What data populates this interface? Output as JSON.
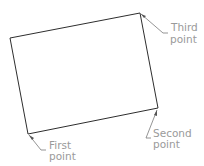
{
  "diagram": {
    "colors": {
      "outline": "#2e2e2e",
      "leader": "#7a7a7a",
      "label": "#9a9a9a",
      "background": "#ffffff"
    },
    "vertices": {
      "first": [
        28,
        134
      ],
      "second": [
        158,
        108
      ],
      "third": [
        140,
        13
      ],
      "fourth": [
        10,
        38
      ]
    },
    "labels": {
      "first": {
        "line1": "First",
        "line2": "point"
      },
      "second": {
        "line1": "Second",
        "line2": "point"
      },
      "third": {
        "line1": "Third",
        "line2": "point"
      }
    }
  }
}
